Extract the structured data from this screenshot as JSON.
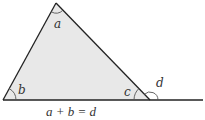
{
  "diagram": {
    "type": "exterior-angle-theorem",
    "colors": {
      "fill": "#e8e8e8",
      "stroke": "#222222",
      "arc": "#555555",
      "text": "#333333",
      "background": "#ffffff"
    },
    "triangle": {
      "vertices": {
        "left": [
          3,
          100
        ],
        "apex": [
          56,
          3
        ],
        "right": [
          150,
          100
        ]
      }
    },
    "baseline": {
      "from": [
        3,
        100
      ],
      "to": [
        203,
        100
      ]
    },
    "angles": [
      {
        "label": "a",
        "vertex": "apex",
        "label_pos": [
          54,
          28
        ]
      },
      {
        "label": "b",
        "vertex": "left",
        "label_pos": [
          18,
          94
        ]
      },
      {
        "label": "c",
        "vertex": "right",
        "label_pos": [
          124,
          96
        ]
      },
      {
        "label": "d",
        "vertex": "right-exterior",
        "label_pos": [
          156,
          87
        ]
      }
    ],
    "caption": "a + b = d"
  }
}
